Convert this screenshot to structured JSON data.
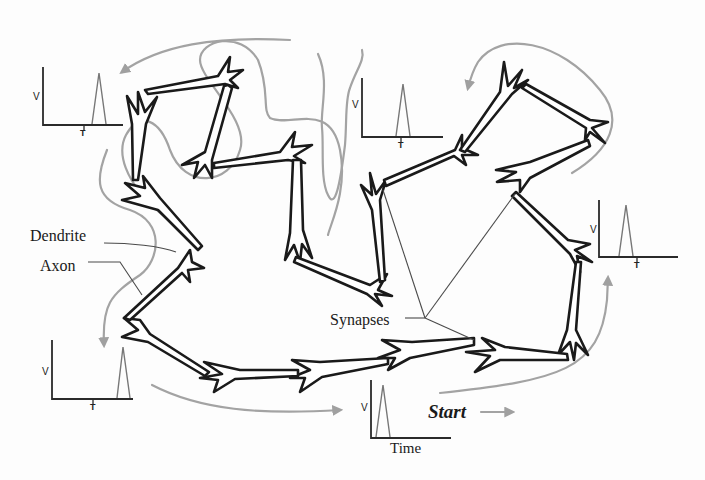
{
  "diagram": {
    "labels": {
      "dendrite": "Dendrite",
      "axon": "Axon",
      "synapses": "Synapses",
      "start": "Start",
      "time": "Time"
    },
    "spike_plots": [
      {
        "id": "top-left",
        "v_label": "V",
        "t_label": "T"
      },
      {
        "id": "top-center",
        "v_label": "V",
        "t_label": "T"
      },
      {
        "id": "right",
        "v_label": "V",
        "t_label": "T"
      },
      {
        "id": "bottom-left",
        "v_label": "V",
        "t_label": "T"
      },
      {
        "id": "bottom-center",
        "v_label": "V",
        "t_label": "Time"
      }
    ],
    "colors": {
      "neuron_outline": "#1a1a1a",
      "neuron_fill": "#ffffff",
      "flow_arrow": "#a0a0a0",
      "pointer_line": "#555555",
      "background": "#fdfdfd"
    }
  }
}
